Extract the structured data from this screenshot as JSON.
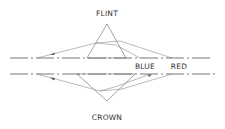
{
  "diagram": {
    "labels": {
      "flint": "FLINT",
      "crown": "CROWN",
      "blue": "BLUE",
      "red": "RED"
    },
    "elements": {
      "upper_prism": {
        "type": "triangle",
        "material": "flint",
        "apex": [
          107,
          24
        ],
        "base_left": [
          87,
          58
        ],
        "base_right": [
          126,
          58
        ]
      },
      "lower_prism": {
        "type": "triangle",
        "material": "crown",
        "apex": [
          107,
          101
        ],
        "base_left": [
          77,
          74
        ],
        "base_right": [
          135,
          74
        ]
      },
      "upper_axis": {
        "y": 58,
        "x_start": 10,
        "x_end": 210,
        "style": "dash-dot"
      },
      "lower_axis": {
        "y": 74,
        "x_start": 10,
        "x_end": 215,
        "style": "dash-dot"
      }
    },
    "colors": {
      "line": "#666666",
      "text": "#333333",
      "background": "#ffffff"
    }
  }
}
